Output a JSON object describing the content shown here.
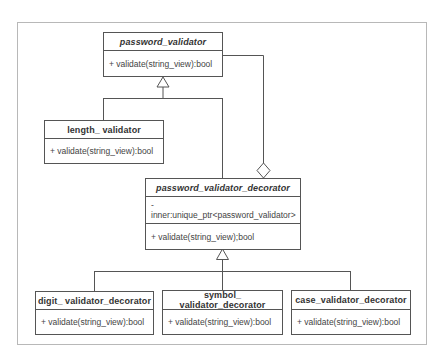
{
  "diagram": {
    "type": "UML class diagram",
    "classes": [
      {
        "id": "password_validator",
        "name": "password_validator",
        "abstract": true,
        "attributes": [],
        "operations": [
          "+ validate(string_view):bool"
        ]
      },
      {
        "id": "length_validator",
        "name": "length_ validator",
        "abstract": false,
        "attributes": [],
        "operations": [
          "+ validate(string_view):bool"
        ]
      },
      {
        "id": "password_validator_decorator",
        "name": "password_validator_decorator",
        "abstract": true,
        "attributes": [
          "- inner:unique_ptr<password_validator>"
        ],
        "operations": [
          "+ validate(string_view);bool"
        ]
      },
      {
        "id": "digit_validator_decorator",
        "name": "digit_ validator_decorator",
        "abstract": false,
        "attributes": [],
        "operations": [
          "+ validate(string_view):bool"
        ]
      },
      {
        "id": "symbol_validator_decorator",
        "name": "symbol_ validator_decorator",
        "abstract": false,
        "attributes": [],
        "operations": [
          "+ validate(string_view):bool"
        ]
      },
      {
        "id": "case_validator_decorator",
        "name": "case_validator_decorator",
        "abstract": false,
        "attributes": [],
        "operations": [
          "+ validate(string_view):bool"
        ]
      }
    ],
    "relationships": [
      {
        "type": "generalization",
        "from": "length_validator",
        "to": "password_validator"
      },
      {
        "type": "generalization",
        "from": "password_validator_decorator",
        "to": "password_validator"
      },
      {
        "type": "aggregation",
        "whole": "password_validator_decorator",
        "part": "password_validator"
      },
      {
        "type": "generalization",
        "from": "digit_validator_decorator",
        "to": "password_validator_decorator"
      },
      {
        "type": "generalization",
        "from": "symbol_validator_decorator",
        "to": "password_validator_decorator"
      },
      {
        "type": "generalization",
        "from": "case_validator_decorator",
        "to": "password_validator_decorator"
      }
    ],
    "colors": {
      "line": "#555555",
      "frame": "#b8b8b8",
      "text": "#333333"
    }
  }
}
